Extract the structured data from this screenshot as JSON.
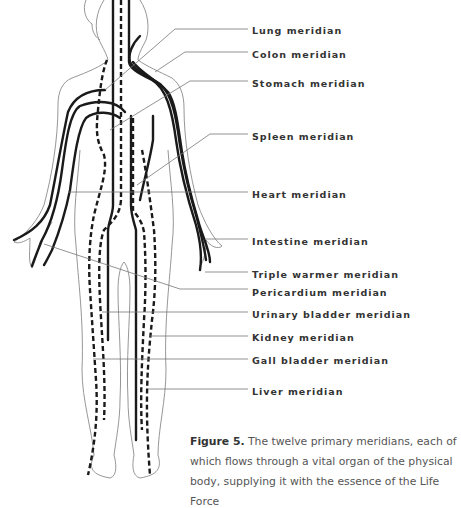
{
  "figure": {
    "labels": [
      {
        "text": "Lung meridian",
        "y": 25
      },
      {
        "text": "Colon meridian",
        "y": 49
      },
      {
        "text": "Stomach meridian",
        "y": 78
      },
      {
        "text": "Spleen meridian",
        "y": 131
      },
      {
        "text": "Heart meridian",
        "y": 189
      },
      {
        "text": "Intestine meridian",
        "y": 236
      },
      {
        "text": "Triple warmer meridian",
        "y": 269
      },
      {
        "text": "Pericardium meridian",
        "y": 287
      },
      {
        "text": "Urinary bladder meridian",
        "y": 309
      },
      {
        "text": "Kidney meridian",
        "y": 332
      },
      {
        "text": "Gall bladder meridian",
        "y": 355
      },
      {
        "text": "Liver meridian",
        "y": 386
      }
    ],
    "caption": {
      "label": "Figure 5.",
      "text": " The twelve primary meridians, each of which flows through a vital organ of the physical body, supplying it with the essence of the Life Force"
    }
  },
  "colors": {
    "meridian_line": "#1a1a1a",
    "outline": "#888888",
    "leader": "#777777",
    "label_text": "#333333",
    "caption_text": "#555555"
  }
}
